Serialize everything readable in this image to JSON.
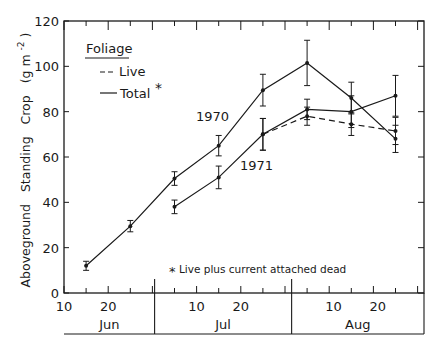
{
  "chart_data": {
    "type": "line",
    "title": "",
    "ylabel": "Aboveground   Standing   Crop   (g m-2)",
    "ylabel_parts": {
      "main": "Aboveground   Standing   Crop",
      "unit_open": "(g m",
      "unit_exp": "-2",
      "unit_close": ")"
    },
    "xlabel": "",
    "ylim": [
      0,
      120
    ],
    "yticks": [
      0,
      20,
      40,
      60,
      80,
      100,
      120
    ],
    "x_day_range": [
      "Jun 10",
      "Aug 29"
    ],
    "x_tick_labels": [
      {
        "label": "10",
        "date": "Jun 10"
      },
      {
        "label": "20",
        "date": "Jun 20"
      },
      {
        "label": "10",
        "date": "Jul 10"
      },
      {
        "label": "20",
        "date": "Jul 20"
      },
      {
        "label": "10",
        "date": "Aug 10"
      },
      {
        "label": "20",
        "date": "Aug 20"
      }
    ],
    "months": [
      "Jun",
      "Jul",
      "Aug"
    ],
    "grid": false,
    "legend": {
      "title": "Foliage",
      "position": "upper-left",
      "entries": [
        {
          "label": "Live",
          "style": "dashed"
        },
        {
          "label": "Total",
          "style": "solid",
          "marker": "*"
        }
      ]
    },
    "annotations": [
      {
        "text": "1970",
        "near": "upper total curve"
      },
      {
        "text": "1971",
        "near": "lower total curve"
      },
      {
        "text": "Live plus current attached dead",
        "marker": "*"
      }
    ],
    "series": [
      {
        "name": "1970 Total",
        "style": "solid",
        "x": [
          "Jun 15",
          "Jun 25",
          "Jul 5",
          "Jul 15",
          "Jul 25",
          "Aug 4",
          "Aug 14",
          "Aug 24"
        ],
        "values": [
          12,
          29.5,
          50.5,
          65,
          89.5,
          101.5,
          86,
          68
        ],
        "error": [
          2,
          2.5,
          3,
          4.5,
          7,
          10,
          7,
          6
        ]
      },
      {
        "name": "1971 Total",
        "style": "solid",
        "x": [
          "Jul 5",
          "Jul 15",
          "Jul 25",
          "Aug 4",
          "Aug 14",
          "Aug 24"
        ],
        "values": [
          38,
          51,
          70,
          81,
          80,
          87
        ],
        "error": [
          3,
          5,
          7,
          4.5,
          7,
          9
        ]
      },
      {
        "name": "1971 Live",
        "style": "dashed",
        "x": [
          "Jul 25",
          "Aug 4",
          "Aug 14",
          "Aug 24"
        ],
        "values": [
          70,
          78,
          74.5,
          71.5
        ],
        "error": [
          7,
          4,
          5,
          6
        ]
      }
    ]
  }
}
